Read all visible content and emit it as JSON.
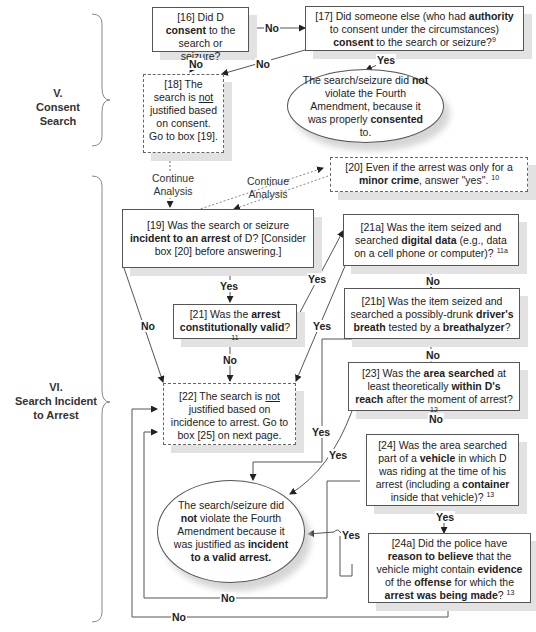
{
  "sections": [
    {
      "id": "V",
      "numeral": "V.",
      "title": "Consent Search"
    },
    {
      "id": "VI",
      "numeral": "VI.",
      "title_line1": "Search Incident",
      "title_line2": "to Arrest"
    }
  ],
  "nodes": {
    "b16": {
      "num": "[16]",
      "t1": "Did D",
      "b1": "consent",
      "t2": "to the search or seizure?"
    },
    "b17": {
      "num": "[17]",
      "t1": "Did someone else (who had",
      "b1": "authority",
      "t2": "to consent under the circumstances)",
      "b2": "consent",
      "t3": "to the search or seizure?",
      "fn": "9"
    },
    "consent_ok": {
      "t1": "The search/seizure did",
      "b1": "not",
      "t2": "violate the Fourth Amendment, because it was properly",
      "b2": "consented",
      "t3": "to."
    },
    "b18": {
      "num": "[18]",
      "t1": "The search is",
      "u1": "not",
      "t2": "justified based on consent. Go to box [19]."
    },
    "b20": {
      "num": "[20]",
      "t1": "Even if the arrest was only for a",
      "b1": "minor crime",
      "t2": ", answer \"yes\".",
      "fn": "10"
    },
    "b19": {
      "num": "[19]",
      "t1": "Was the search or seizure",
      "b1": "incident to an arrest",
      "t2": "of D? [Consider box [20] before answering.]"
    },
    "b21a": {
      "num": "[21a]",
      "t1": "Was the item seized and searched",
      "b1": "digital data",
      "t2": "(e.g., data on a cell phone or computer)?",
      "fn": "11a"
    },
    "b21": {
      "num": "[21]",
      "t1": "Was the",
      "b1": "arrest constitutionally valid",
      "t2": "?",
      "fn": "11"
    },
    "b21b": {
      "num": "[21b]",
      "t1": "Was the item seized and searched a possibly-drunk",
      "b1": "driver's breath",
      "t2": "tested by a",
      "b2": "breathalyzer",
      "t3": "?"
    },
    "b22": {
      "num": "[22]",
      "t1": "The search is",
      "u1": "not",
      "t2": "justified based on incidence to arrest. Go to box [25] on next page."
    },
    "b23": {
      "num": "[23]",
      "t1": "Was the",
      "b1": "area searched",
      "t2": "at least theoretically",
      "b2": "within D's reach",
      "t3": "after the moment of arrest?",
      "fn": "12"
    },
    "b24": {
      "num": "[24]",
      "t1": "Was the area searched part of a",
      "b1": "vehicle",
      "t2": "in which D was riding at the time of his arrest (including a",
      "b2": "container",
      "t3": "inside that vehicle)?",
      "fn": "13"
    },
    "arrest_ok": {
      "t1": "The search/seizure did",
      "b1": "not",
      "t2": "violate the Fourth Amendment because it was justified as",
      "b2": "incident to a valid arrest."
    },
    "b24a": {
      "num": "[24a]",
      "t1": "Did the police have",
      "b1": "reason to believe",
      "t2": "that the vehicle might contain",
      "b2": "evidence",
      "t3": "of the",
      "b3": "offense",
      "t4": "for which the",
      "b4": "arrest was being made",
      "t5": "?",
      "fn": "13"
    }
  },
  "edge_labels": {
    "yes": "Yes",
    "no": "No",
    "continue_1": "Continue",
    "continue_2": "Analysis"
  }
}
